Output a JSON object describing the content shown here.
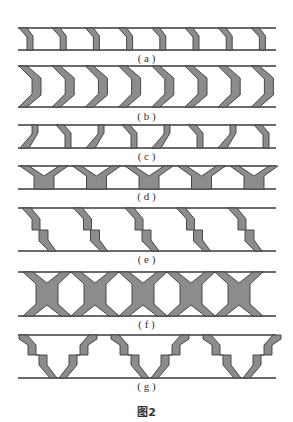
{
  "figure": {
    "title": "图2",
    "subfigures": [
      {
        "id": "a",
        "caption": "( a )",
        "pattern": "slanted-bar",
        "count": 8
      },
      {
        "id": "b",
        "caption": "( b )",
        "pattern": "chevron",
        "count": 8
      },
      {
        "id": "c",
        "caption": "( c )",
        "pattern": "alternating-slanted-bar",
        "count": 8
      },
      {
        "id": "d",
        "caption": "( d )",
        "pattern": "y-shape",
        "count": 5
      },
      {
        "id": "e",
        "caption": "( e )",
        "pattern": "stepped-zigzag",
        "count": 5
      },
      {
        "id": "f",
        "caption": "( f )",
        "pattern": "x-shape",
        "count": 5
      },
      {
        "id": "g",
        "caption": "( g )",
        "pattern": "stepped-v",
        "count": 3
      }
    ]
  },
  "colors": {
    "fill": "#8c8c8c",
    "stroke": "#3a3a3a",
    "background": "#ffffff"
  }
}
